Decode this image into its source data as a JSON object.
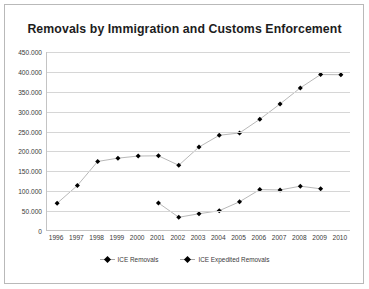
{
  "chart_data": {
    "type": "line",
    "title": "Removals by Immigration and Customs Enforcement",
    "xlabel": "",
    "ylabel": "",
    "categories": [
      "1996",
      "1997",
      "1998",
      "1999",
      "2000",
      "2001",
      "2002",
      "2003",
      "2004",
      "2005",
      "2006",
      "2007",
      "2008",
      "2009",
      "2010"
    ],
    "ylim": [
      0,
      450000
    ],
    "ytick_step": 50000,
    "ytick_labels": [
      "0",
      "50.000",
      "100.000",
      "150.000",
      "200.000",
      "250.000",
      "300.000",
      "350.000",
      "400.000",
      "450.000"
    ],
    "grid": true,
    "legend_position": "bottom",
    "series": [
      {
        "name": "ICE Removals",
        "color": "#000000",
        "line_color": "#a6a6a6",
        "values": [
          69680,
          114432,
          174813,
          183114,
          188467,
          189026,
          165168,
          211098,
          240665,
          246431,
          280974,
          319382,
          359795,
          393289,
          392862
        ]
      },
      {
        "name": "ICE Expedited Removals",
        "color": "#000000",
        "line_color": "#a6a6a6",
        "values": [
          null,
          null,
          null,
          null,
          null,
          70521,
          34536,
          43350,
          51014,
          73476,
          104161,
          103152,
          112716,
          106025,
          null
        ]
      }
    ]
  },
  "legend": {
    "entries": [
      {
        "label": "ICE Removals"
      },
      {
        "label": "ICE Expedited Removals"
      }
    ]
  }
}
